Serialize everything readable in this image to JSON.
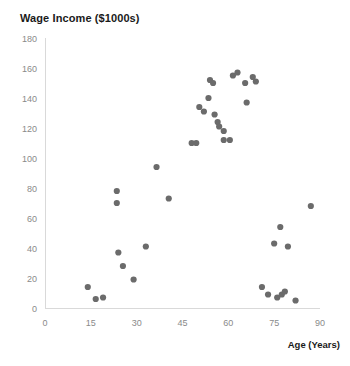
{
  "chart_data": {
    "type": "scatter",
    "title": "Wage Income ($1000s)",
    "xlabel": "Age (Years)",
    "ylabel": "",
    "xlim": [
      0,
      90
    ],
    "ylim": [
      0,
      180
    ],
    "xticks": [
      0,
      15,
      30,
      45,
      60,
      75,
      90
    ],
    "yticks": [
      0,
      20,
      40,
      60,
      80,
      100,
      120,
      140,
      160,
      180
    ],
    "grid": false,
    "legend": false,
    "marker_color": "#6b6b6b",
    "points": [
      {
        "x": 14,
        "y": 14
      },
      {
        "x": 16.6,
        "y": 6
      },
      {
        "x": 19,
        "y": 7
      },
      {
        "x": 23.5,
        "y": 78
      },
      {
        "x": 23.5,
        "y": 70
      },
      {
        "x": 24,
        "y": 37
      },
      {
        "x": 25.5,
        "y": 28
      },
      {
        "x": 29,
        "y": 19
      },
      {
        "x": 33,
        "y": 41
      },
      {
        "x": 36.5,
        "y": 94
      },
      {
        "x": 40.5,
        "y": 73
      },
      {
        "x": 48,
        "y": 110
      },
      {
        "x": 49.5,
        "y": 110
      },
      {
        "x": 50.5,
        "y": 134
      },
      {
        "x": 52,
        "y": 131
      },
      {
        "x": 53.5,
        "y": 140
      },
      {
        "x": 54,
        "y": 152
      },
      {
        "x": 55,
        "y": 150
      },
      {
        "x": 55.5,
        "y": 129
      },
      {
        "x": 56.5,
        "y": 124
      },
      {
        "x": 57,
        "y": 121
      },
      {
        "x": 58.5,
        "y": 118
      },
      {
        "x": 58.5,
        "y": 112
      },
      {
        "x": 60.5,
        "y": 112
      },
      {
        "x": 61.5,
        "y": 155
      },
      {
        "x": 63,
        "y": 157
      },
      {
        "x": 65.5,
        "y": 150
      },
      {
        "x": 66,
        "y": 137
      },
      {
        "x": 68,
        "y": 154
      },
      {
        "x": 69,
        "y": 151
      },
      {
        "x": 71,
        "y": 14
      },
      {
        "x": 73,
        "y": 9
      },
      {
        "x": 75,
        "y": 43
      },
      {
        "x": 77,
        "y": 54
      },
      {
        "x": 76,
        "y": 7
      },
      {
        "x": 77.5,
        "y": 9
      },
      {
        "x": 78.5,
        "y": 11
      },
      {
        "x": 79.5,
        "y": 41
      },
      {
        "x": 82,
        "y": 5
      },
      {
        "x": 87,
        "y": 68
      }
    ]
  }
}
